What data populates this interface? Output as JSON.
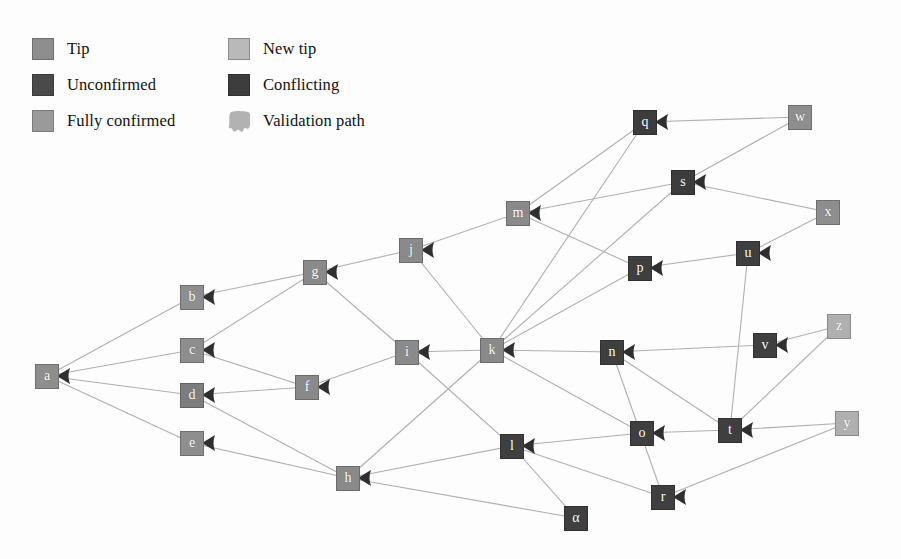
{
  "diagram": {
    "background": "#fdfdfd"
  },
  "legend": {
    "items": [
      {
        "label": "Tip",
        "swatch": "legend-swatch-tip",
        "color": "#8e8e8e",
        "border": "#6f6f6f",
        "shape": "square",
        "row": 0,
        "col": 0
      },
      {
        "label": "New tip",
        "swatch": "legend-swatch-new-tip",
        "color": "#b9b9b9",
        "border": "#8d8d8d",
        "shape": "square",
        "row": 0,
        "col": 1
      },
      {
        "label": "Unconfirmed",
        "swatch": "legend-swatch-unconfirmed",
        "color": "#4a4a4a",
        "border": "#3a3a3a",
        "shape": "square",
        "row": 1,
        "col": 0
      },
      {
        "label": "Conflicting",
        "swatch": "legend-swatch-conflicting",
        "color": "#3c3c3c",
        "border": "#303030",
        "shape": "square",
        "row": 1,
        "col": 1
      },
      {
        "label": "Fully confirmed",
        "swatch": "legend-swatch-fully-confirmed",
        "color": "#9a9a9a",
        "border": "#7d7d7d",
        "shape": "square",
        "row": 2,
        "col": 0
      },
      {
        "label": "Validation path",
        "swatch": "legend-swatch-validation-path",
        "color": "#b2b2b2",
        "border": "#b2b2b2",
        "shape": "blob",
        "row": 2,
        "col": 1
      }
    ]
  },
  "graph": {
    "edge_color": "#b0b0b0",
    "edge_width": 1.1,
    "arrow_color": "#2f2f2f",
    "node_size": 24,
    "nodes": [
      {
        "id": "a",
        "label": "a",
        "x": 47,
        "y": 376,
        "fill": "#8e8e8e",
        "stroke": "#6e6e6e",
        "state": "fully-confirmed"
      },
      {
        "id": "b",
        "label": "b",
        "x": 192,
        "y": 297,
        "fill": "#8e8e8e",
        "stroke": "#6e6e6e",
        "state": "fully-confirmed"
      },
      {
        "id": "c",
        "label": "c",
        "x": 192,
        "y": 350,
        "fill": "#8e8e8e",
        "stroke": "#6e6e6e",
        "state": "fully-confirmed"
      },
      {
        "id": "d",
        "label": "d",
        "x": 192,
        "y": 395,
        "fill": "#7d7d7d",
        "stroke": "#636363",
        "state": "fully-confirmed"
      },
      {
        "id": "e",
        "label": "e",
        "x": 192,
        "y": 443,
        "fill": "#8e8e8e",
        "stroke": "#6e6e6e",
        "state": "fully-confirmed"
      },
      {
        "id": "f",
        "label": "f",
        "x": 307,
        "y": 387,
        "fill": "#8a8a8a",
        "stroke": "#6b6b6b",
        "state": "fully-confirmed"
      },
      {
        "id": "g",
        "label": "g",
        "x": 315,
        "y": 272,
        "fill": "#8a8a8a",
        "stroke": "#6b6b6b",
        "state": "fully-confirmed"
      },
      {
        "id": "h",
        "label": "h",
        "x": 348,
        "y": 478,
        "fill": "#8a8a8a",
        "stroke": "#6b6b6b",
        "state": "fully-confirmed"
      },
      {
        "id": "i",
        "label": "i",
        "x": 407,
        "y": 352,
        "fill": "#8a8a8a",
        "stroke": "#6b6b6b",
        "state": "fully-confirmed"
      },
      {
        "id": "j",
        "label": "j",
        "x": 411,
        "y": 250,
        "fill": "#8a8a8a",
        "stroke": "#6b6b6b",
        "state": "fully-confirmed"
      },
      {
        "id": "k",
        "label": "k",
        "x": 492,
        "y": 350,
        "fill": "#8a8a8a",
        "stroke": "#6b6b6b",
        "state": "tip"
      },
      {
        "id": "l",
        "label": "l",
        "x": 512,
        "y": 446,
        "fill": "#3f3f3f",
        "stroke": "#313131",
        "state": "unconfirmed"
      },
      {
        "id": "m",
        "label": "m",
        "x": 518,
        "y": 213,
        "fill": "#8a8a8a",
        "stroke": "#6b6b6b",
        "state": "tip"
      },
      {
        "id": "n",
        "label": "n",
        "x": 612,
        "y": 352,
        "fill": "#3f3f3f",
        "stroke": "#313131",
        "state": "unconfirmed"
      },
      {
        "id": "o",
        "label": "o",
        "x": 642,
        "y": 433,
        "fill": "#3f3f3f",
        "stroke": "#313131",
        "state": "unconfirmed"
      },
      {
        "id": "p",
        "label": "p",
        "x": 640,
        "y": 268,
        "fill": "#3f3f3f",
        "stroke": "#313131",
        "state": "unconfirmed"
      },
      {
        "id": "q",
        "label": "q",
        "x": 645,
        "y": 122,
        "fill": "#3c3c3c",
        "stroke": "#2e2e2e",
        "state": "conflicting"
      },
      {
        "id": "r",
        "label": "r",
        "x": 663,
        "y": 497,
        "fill": "#3f3f3f",
        "stroke": "#313131",
        "state": "unconfirmed"
      },
      {
        "id": "s",
        "label": "s",
        "x": 683,
        "y": 182,
        "fill": "#3c3c3c",
        "stroke": "#2e2e2e",
        "state": "conflicting"
      },
      {
        "id": "t",
        "label": "t",
        "x": 730,
        "y": 430,
        "fill": "#3f3f3f",
        "stroke": "#313131",
        "state": "unconfirmed"
      },
      {
        "id": "u",
        "label": "u",
        "x": 748,
        "y": 253,
        "fill": "#3f3f3f",
        "stroke": "#313131",
        "state": "unconfirmed"
      },
      {
        "id": "v",
        "label": "v",
        "x": 765,
        "y": 345,
        "fill": "#3f3f3f",
        "stroke": "#313131",
        "state": "unconfirmed"
      },
      {
        "id": "w",
        "label": "w",
        "x": 800,
        "y": 117,
        "fill": "#8e8e8e",
        "stroke": "#6e6e6e",
        "state": "tip"
      },
      {
        "id": "x",
        "label": "x",
        "x": 828,
        "y": 212,
        "fill": "#8e8e8e",
        "stroke": "#6e6e6e",
        "state": "tip"
      },
      {
        "id": "y",
        "label": "y",
        "x": 847,
        "y": 423,
        "fill": "#b0b0b0",
        "stroke": "#8a8a8a",
        "state": "new-tip"
      },
      {
        "id": "z",
        "label": "z",
        "x": 839,
        "y": 326,
        "fill": "#b0b0b0",
        "stroke": "#8a8a8a",
        "state": "new-tip"
      },
      {
        "id": "alpha",
        "label": "α",
        "x": 576,
        "y": 518,
        "fill": "#3f3f3f",
        "stroke": "#313131",
        "state": "unconfirmed"
      }
    ],
    "edges": [
      {
        "from": "b",
        "to": "a"
      },
      {
        "from": "c",
        "to": "a"
      },
      {
        "from": "d",
        "to": "a"
      },
      {
        "from": "e",
        "to": "a"
      },
      {
        "from": "g",
        "to": "b"
      },
      {
        "from": "g",
        "to": "c"
      },
      {
        "from": "f",
        "to": "c"
      },
      {
        "from": "f",
        "to": "d"
      },
      {
        "from": "h",
        "to": "d"
      },
      {
        "from": "h",
        "to": "e"
      },
      {
        "from": "j",
        "to": "g"
      },
      {
        "from": "i",
        "to": "g"
      },
      {
        "from": "i",
        "to": "f"
      },
      {
        "from": "m",
        "to": "j"
      },
      {
        "from": "k",
        "to": "j"
      },
      {
        "from": "k",
        "to": "i"
      },
      {
        "from": "l",
        "to": "i"
      },
      {
        "from": "l",
        "to": "h"
      },
      {
        "from": "k",
        "to": "h"
      },
      {
        "from": "alpha",
        "to": "h"
      },
      {
        "from": "q",
        "to": "m"
      },
      {
        "from": "s",
        "to": "m"
      },
      {
        "from": "p",
        "to": "m"
      },
      {
        "from": "n",
        "to": "k"
      },
      {
        "from": "o",
        "to": "k"
      },
      {
        "from": "p",
        "to": "k"
      },
      {
        "from": "q",
        "to": "k"
      },
      {
        "from": "s",
        "to": "k"
      },
      {
        "from": "r",
        "to": "l"
      },
      {
        "from": "o",
        "to": "l"
      },
      {
        "from": "alpha",
        "to": "l"
      },
      {
        "from": "w",
        "to": "q"
      },
      {
        "from": "w",
        "to": "s"
      },
      {
        "from": "x",
        "to": "s"
      },
      {
        "from": "u",
        "to": "p"
      },
      {
        "from": "x",
        "to": "u"
      },
      {
        "from": "t",
        "to": "u"
      },
      {
        "from": "v",
        "to": "n"
      },
      {
        "from": "t",
        "to": "n"
      },
      {
        "from": "z",
        "to": "v"
      },
      {
        "from": "z",
        "to": "t"
      },
      {
        "from": "y",
        "to": "t"
      },
      {
        "from": "t",
        "to": "o"
      },
      {
        "from": "y",
        "to": "r"
      },
      {
        "from": "r",
        "to": "n"
      }
    ]
  }
}
